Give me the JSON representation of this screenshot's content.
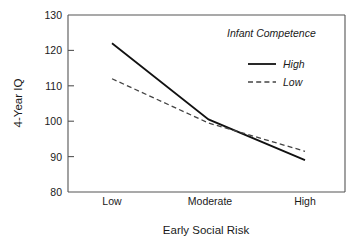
{
  "chart_data": {
    "type": "line",
    "title": "",
    "xlabel": "Early Social Risk",
    "ylabel": "4-Year IQ",
    "categories": [
      "Low",
      "Moderate",
      "High"
    ],
    "ylim": [
      80,
      130
    ],
    "yticks": [
      80,
      90,
      100,
      110,
      120,
      130
    ],
    "ytick_labels": [
      "80",
      "90",
      "100",
      "110",
      "120",
      "130"
    ],
    "grid": false,
    "legend_position": "top-right",
    "legend_title": "Infant Competence",
    "series": [
      {
        "name": "High",
        "style": "solid",
        "color": "#111111",
        "values": [
          122,
          100.5,
          89
        ]
      },
      {
        "name": "Low",
        "style": "dashed",
        "color": "#444444",
        "values": [
          112,
          99.5,
          91.5
        ]
      }
    ]
  },
  "axes": {
    "y_title": "4-Year IQ",
    "x_title": "Early Social Risk",
    "y_ticks": [
      "130",
      "120",
      "110",
      "100",
      "90",
      "80"
    ],
    "x_ticks": [
      "Low",
      "Moderate",
      "High"
    ]
  },
  "legend": {
    "title": "Infant Competence",
    "entries": [
      {
        "label": "High",
        "style": "solid"
      },
      {
        "label": "Low",
        "style": "dashed"
      }
    ]
  }
}
